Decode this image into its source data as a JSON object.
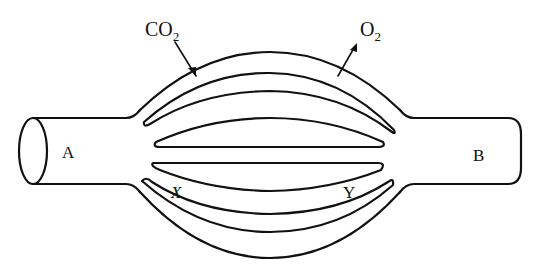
{
  "diagram": {
    "type": "blood vessel / capillary network diagram",
    "labels": {
      "a": "A",
      "b": "B",
      "x": "X",
      "y": "Y",
      "co2_main": "CO",
      "co2_sub": "2",
      "o2_main": "O",
      "o2_sub": "2"
    },
    "arrows": [
      {
        "gas": "CO2",
        "direction": "into vessel"
      },
      {
        "gas": "O2",
        "direction": "out of vessel"
      }
    ],
    "colors": {
      "stroke": "#111111",
      "background": "#ffffff"
    }
  }
}
